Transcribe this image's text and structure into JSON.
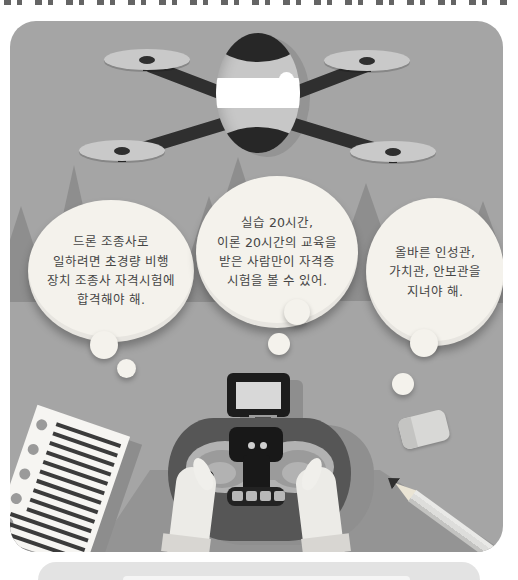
{
  "bubbles": {
    "left": {
      "lines": [
        "드론 조종사로",
        "일하려면 초경량 비행",
        "장치 조종사 자격시험에",
        "합격해야 해."
      ]
    },
    "center": {
      "lines": [
        "실습 20시간,",
        "이론 20시간의 교육을",
        "받은 사람만이 자격증",
        "시험을 볼 수 있어."
      ]
    },
    "right": {
      "lines": [
        "올바른 인성관,",
        "가치관, 안보관을",
        "지녀야 해."
      ]
    }
  },
  "colors": {
    "page_background": "#ffffff",
    "scene_background": "#a5a5a5",
    "mountain_gray": "#8e8e8e",
    "bubble_fill": "#f4f2ec",
    "bubble_text": "#454545",
    "drone_dark": "#272727",
    "drone_body": "#c7c7c7",
    "drone_band": "#ffffff",
    "controller_body": "#565656",
    "controller_panel": "#181818",
    "stick_plate": "#b2b2b2",
    "hand": "#ecebe7",
    "paper": "#f6f5f2",
    "bottom_card": "#e3e3e3"
  }
}
